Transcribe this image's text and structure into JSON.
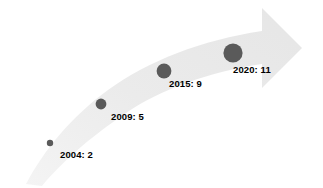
{
  "figure": {
    "name": "growth-arrow-timeline",
    "background_color": "#ffffff",
    "arrow_color": "#ececec",
    "arrow_color_light": "#f2f2f2",
    "bubble_color": "#5a5a5a",
    "label_color": "#000000"
  },
  "chart_data": {
    "type": "scatter",
    "title": "",
    "subtitle": "",
    "xlabel": "",
    "ylabel": "",
    "grid": false,
    "legend": "none",
    "annotation": "upward curved arrow showing growth over time",
    "categories": [
      "2004",
      "2009",
      "2015",
      "2020"
    ],
    "values": [
      2,
      5,
      9,
      11
    ],
    "series": [
      {
        "name": "count",
        "values": [
          2,
          5,
          9,
          11
        ]
      }
    ],
    "points": [
      {
        "year": "2004",
        "value": 2,
        "label": "2004: 2",
        "cx": 50,
        "cy": 143,
        "r": 3.2,
        "label_x": 60,
        "label_y": 149
      },
      {
        "year": "2009",
        "value": 5,
        "label": "2009: 5",
        "cx": 101,
        "cy": 104,
        "r": 5.4,
        "label_x": 111,
        "label_y": 111
      },
      {
        "year": "2015",
        "value": 9,
        "label": "2015: 9",
        "cx": 164,
        "cy": 71,
        "r": 7.4,
        "label_x": 169,
        "label_y": 78
      },
      {
        "year": "2020",
        "value": 11,
        "label": "2020: 11",
        "cx": 233,
        "cy": 53,
        "r": 9.6,
        "label_x": 233,
        "label_y": 64
      }
    ]
  }
}
